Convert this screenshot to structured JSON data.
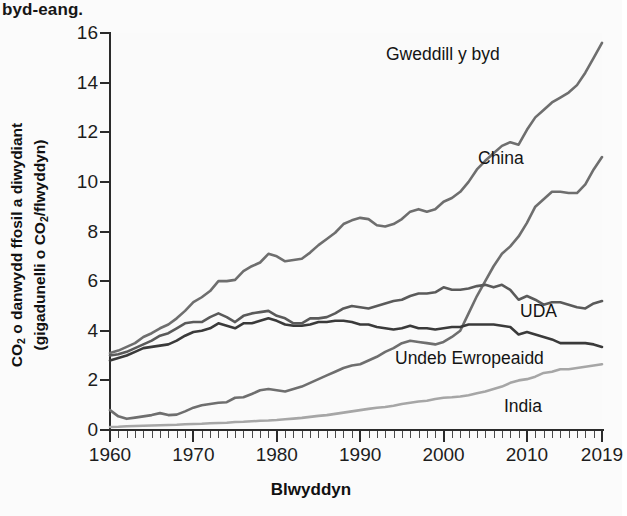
{
  "caption_fragment": "byd-eang.",
  "axis": {
    "y_title_line1": "CO2 o danwydd ffosil a diwydiant",
    "y_title_line2": "(gigadunelli o CO2/flwyddyn)",
    "x_title": "Blwyddyn"
  },
  "annotations": {
    "rest_of_world": "Gweddill y byd",
    "china": "China",
    "usa": "UDA",
    "eu": "Undeb Ewropeaidd",
    "india": "India"
  },
  "chart_data": {
    "type": "line",
    "title": "",
    "xlabel": "Blwyddyn",
    "ylabel": "CO2 o danwydd ffosil a diwydiant (gigadunelli o CO2/flwyddyn)",
    "xlim": [
      1960,
      2019
    ],
    "ylim": [
      0,
      16
    ],
    "yticks": [
      0,
      2,
      4,
      6,
      8,
      10,
      12,
      14,
      16
    ],
    "xticks": [
      1960,
      1970,
      1980,
      1990,
      2000,
      2010,
      2019
    ],
    "xtick_labels": [
      "1960",
      "1970",
      "1980",
      "1990",
      "2000",
      "2010",
      "2019"
    ],
    "ytick_labels": [
      "0",
      "2",
      "4",
      "6",
      "8",
      "10",
      "12",
      "14",
      "16"
    ],
    "minor_x_tick_step": 1,
    "grid": false,
    "legend": "inline-annotations",
    "x": [
      1960,
      1961,
      1962,
      1963,
      1964,
      1965,
      1966,
      1967,
      1968,
      1969,
      1970,
      1971,
      1972,
      1973,
      1974,
      1975,
      1976,
      1977,
      1978,
      1979,
      1980,
      1981,
      1982,
      1983,
      1984,
      1985,
      1986,
      1987,
      1988,
      1989,
      1990,
      1991,
      1992,
      1993,
      1994,
      1995,
      1996,
      1997,
      1998,
      1999,
      2000,
      2001,
      2002,
      2003,
      2004,
      2005,
      2006,
      2007,
      2008,
      2009,
      2010,
      2011,
      2012,
      2013,
      2014,
      2015,
      2016,
      2017,
      2018,
      2019
    ],
    "series": [
      {
        "name": "Gweddill y byd",
        "color": "#6e6e6e",
        "values": [
          3.1,
          3.2,
          3.35,
          3.5,
          3.75,
          3.9,
          4.1,
          4.25,
          4.5,
          4.8,
          5.15,
          5.35,
          5.6,
          6.0,
          6.0,
          6.05,
          6.4,
          6.6,
          6.75,
          7.1,
          7.0,
          6.8,
          6.85,
          6.9,
          7.15,
          7.45,
          7.7,
          7.95,
          8.3,
          8.45,
          8.55,
          8.5,
          8.25,
          8.2,
          8.3,
          8.5,
          8.8,
          8.9,
          8.8,
          8.9,
          9.2,
          9.35,
          9.6,
          10.0,
          10.5,
          10.85,
          11.15,
          11.45,
          11.6,
          11.5,
          12.1,
          12.6,
          12.9,
          13.2,
          13.4,
          13.6,
          13.9,
          14.4,
          15.0,
          15.6
        ]
      },
      {
        "name": "China",
        "color": "#6e6e6e",
        "values": [
          0.8,
          0.55,
          0.45,
          0.5,
          0.55,
          0.6,
          0.68,
          0.6,
          0.62,
          0.75,
          0.9,
          1.0,
          1.05,
          1.1,
          1.12,
          1.3,
          1.32,
          1.45,
          1.6,
          1.65,
          1.6,
          1.55,
          1.65,
          1.75,
          1.9,
          2.05,
          2.2,
          2.35,
          2.5,
          2.6,
          2.65,
          2.8,
          2.95,
          3.15,
          3.3,
          3.5,
          3.6,
          3.55,
          3.5,
          3.45,
          3.55,
          3.75,
          4.0,
          4.7,
          5.4,
          6.0,
          6.6,
          7.1,
          7.4,
          7.8,
          8.35,
          9.0,
          9.3,
          9.6,
          9.6,
          9.55,
          9.55,
          9.9,
          10.5,
          11.0
        ]
      },
      {
        "name": "UDA",
        "color": "#5a5a5a",
        "values": [
          3.0,
          3.05,
          3.15,
          3.3,
          3.45,
          3.6,
          3.8,
          3.9,
          4.1,
          4.3,
          4.35,
          4.35,
          4.55,
          4.7,
          4.55,
          4.35,
          4.6,
          4.7,
          4.75,
          4.8,
          4.6,
          4.5,
          4.3,
          4.3,
          4.5,
          4.5,
          4.55,
          4.7,
          4.9,
          5.0,
          4.95,
          4.9,
          5.0,
          5.1,
          5.2,
          5.25,
          5.4,
          5.5,
          5.5,
          5.55,
          5.75,
          5.65,
          5.65,
          5.7,
          5.8,
          5.85,
          5.75,
          5.85,
          5.65,
          5.25,
          5.4,
          5.25,
          5.05,
          5.15,
          5.15,
          5.05,
          4.95,
          4.9,
          5.1,
          5.2
        ]
      },
      {
        "name": "Undeb Ewropeaidd",
        "color": "#3a3a3a",
        "values": [
          2.8,
          2.9,
          3.0,
          3.15,
          3.3,
          3.35,
          3.4,
          3.45,
          3.6,
          3.8,
          3.95,
          4.0,
          4.1,
          4.3,
          4.2,
          4.1,
          4.3,
          4.3,
          4.4,
          4.5,
          4.4,
          4.25,
          4.2,
          4.2,
          4.25,
          4.35,
          4.35,
          4.4,
          4.4,
          4.35,
          4.25,
          4.25,
          4.15,
          4.1,
          4.05,
          4.1,
          4.2,
          4.1,
          4.1,
          4.05,
          4.1,
          4.15,
          4.15,
          4.25,
          4.25,
          4.25,
          4.25,
          4.2,
          4.15,
          3.85,
          3.95,
          3.85,
          3.75,
          3.65,
          3.5,
          3.5,
          3.5,
          3.5,
          3.45,
          3.35
        ]
      },
      {
        "name": "India",
        "color": "#a6a6a6",
        "values": [
          0.12,
          0.13,
          0.15,
          0.16,
          0.17,
          0.18,
          0.19,
          0.2,
          0.21,
          0.23,
          0.24,
          0.25,
          0.27,
          0.28,
          0.29,
          0.32,
          0.33,
          0.35,
          0.37,
          0.38,
          0.4,
          0.43,
          0.46,
          0.49,
          0.53,
          0.57,
          0.6,
          0.65,
          0.7,
          0.75,
          0.8,
          0.85,
          0.9,
          0.93,
          0.98,
          1.05,
          1.1,
          1.15,
          1.18,
          1.25,
          1.3,
          1.32,
          1.35,
          1.4,
          1.48,
          1.55,
          1.65,
          1.75,
          1.9,
          2.0,
          2.05,
          2.15,
          2.3,
          2.35,
          2.45,
          2.45,
          2.5,
          2.55,
          2.6,
          2.65
        ]
      }
    ]
  }
}
